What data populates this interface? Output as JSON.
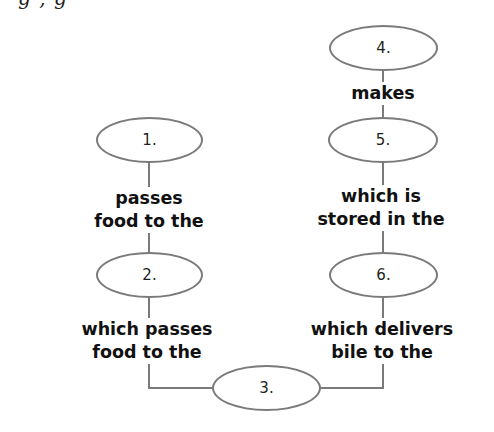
{
  "page": {
    "cutoff_top_text": "g , g"
  },
  "colors": {
    "node_border": "#7a7a7a",
    "connector": "#7a7a7a",
    "label_text": "#111111",
    "node_text": "#231f20",
    "background": "#ffffff"
  },
  "diagram": {
    "type": "concept-map",
    "nodes": [
      {
        "id": "n1",
        "label": "1."
      },
      {
        "id": "n2",
        "label": "2."
      },
      {
        "id": "n3",
        "label": "3."
      },
      {
        "id": "n4",
        "label": "4."
      },
      {
        "id": "n5",
        "label": "5."
      },
      {
        "id": "n6",
        "label": "6."
      }
    ],
    "links": [
      {
        "from": "n1",
        "to": "n2",
        "lines": [
          "passes",
          "food to the"
        ]
      },
      {
        "from": "n2",
        "to": "n3",
        "lines": [
          "which passes",
          "food to the"
        ]
      },
      {
        "from": "n4",
        "to": "n5",
        "lines": [
          "makes"
        ]
      },
      {
        "from": "n5",
        "to": "n6",
        "lines": [
          "which is",
          "stored in the"
        ]
      },
      {
        "from": "n6",
        "to": "n3",
        "lines": [
          "which delivers",
          "bile to the"
        ]
      }
    ]
  }
}
